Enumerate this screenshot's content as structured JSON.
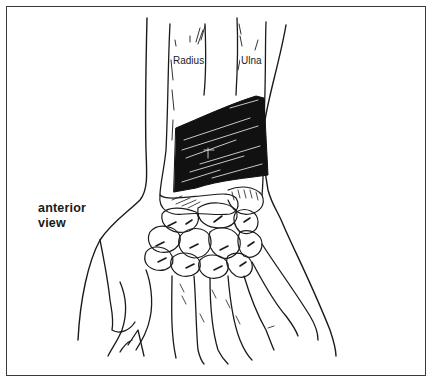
{
  "figure": {
    "labels": {
      "radius": "Radius",
      "ulna": "Ulna",
      "view_line1": "anterior",
      "view_line2": "view"
    },
    "colors": {
      "ink": "#1a1a1a",
      "frame": "#3a3a3a",
      "background": "#ffffff"
    }
  }
}
